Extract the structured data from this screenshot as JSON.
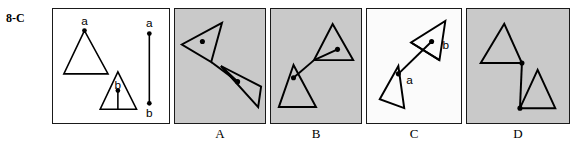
{
  "item": {
    "number": "8-C"
  },
  "stem_panel": {
    "name": "stem",
    "background": "#ffffff",
    "labels": {
      "triangle_a": "a",
      "triangle_b": "b",
      "segment_top": "a",
      "segment_bottom": "b"
    },
    "shapes": [
      {
        "type": "triangle",
        "label": "a",
        "points": "32,22 11,66 56,66",
        "vertex_dot": {
          "x": 32,
          "y": 22
        }
      },
      {
        "type": "triangle",
        "label": "b",
        "points": "66,64 48,102 85,102",
        "vertex_dot": {
          "x": 66,
          "y": 83
        },
        "stem_line": {
          "x1": 66,
          "y1": 83,
          "x2": 66,
          "y2": 102
        }
      },
      {
        "type": "segment",
        "x1": 98,
        "y1": 25,
        "x2": 98,
        "y2": 96,
        "endpoint_labels": [
          "a",
          "b"
        ]
      }
    ]
  },
  "options": [
    {
      "key": "A",
      "label": "A",
      "background": "#c9c9c9",
      "shapes": [
        {
          "type": "triangle",
          "points": "48,14 7,36 37,54"
        },
        {
          "type": "triangle",
          "points": "85,100 47,58 88,79"
        },
        {
          "type": "connector",
          "x1": 37,
          "y1": 54,
          "x2": 64,
          "y2": 74
        },
        {
          "type": "spoke",
          "x1": 37,
          "y1": 54,
          "x2": 7,
          "y2": 36
        },
        {
          "type": "dot",
          "x": 28,
          "y": 33
        },
        {
          "type": "dot",
          "x": 64,
          "y": 74
        }
      ]
    },
    {
      "key": "B",
      "label": "B",
      "background": "#c9c9c9",
      "shapes": [
        {
          "type": "triangle",
          "points": "63,15 84,52 44,52"
        },
        {
          "type": "triangle",
          "points": "23,57 8,100 46,100"
        },
        {
          "type": "connector",
          "x1": 44,
          "y1": 52,
          "x2": 23,
          "y2": 70
        },
        {
          "type": "spoke",
          "x1": 44,
          "y1": 52,
          "x2": 68,
          "y2": 41
        },
        {
          "type": "dot",
          "x": 68,
          "y": 41
        },
        {
          "type": "dot",
          "x": 23,
          "y": 70
        }
      ]
    },
    {
      "key": "C",
      "label": "C",
      "background": "#fbfbfb",
      "labels": {
        "dot_a": "a",
        "dot_b": "b"
      },
      "shapes": [
        {
          "type": "triangle",
          "points": "80,12 74,52 45,34"
        },
        {
          "type": "triangle",
          "points": "13,92 32,58 38,101"
        },
        {
          "type": "connector",
          "x1": 66,
          "y1": 33,
          "x2": 32,
          "y2": 66
        },
        {
          "type": "spoke",
          "x1": 45,
          "y1": 34,
          "x2": 74,
          "y2": 52
        },
        {
          "type": "dot",
          "x": 66,
          "y": 33,
          "label": "b"
        },
        {
          "type": "dot",
          "x": 32,
          "y": 66,
          "label": "a"
        }
      ]
    },
    {
      "key": "D",
      "label": "D",
      "background": "#c9c9c9",
      "shapes": [
        {
          "type": "triangle",
          "points": "38,15 14,55 56,55"
        },
        {
          "type": "triangle",
          "points": "72,62 54,101 90,101"
        },
        {
          "type": "connector",
          "x1": 56,
          "y1": 55,
          "x2": 54,
          "y2": 101
        },
        {
          "type": "dot",
          "x": 56,
          "y": 55
        },
        {
          "type": "dot",
          "x": 54,
          "y": 101
        }
      ]
    }
  ]
}
